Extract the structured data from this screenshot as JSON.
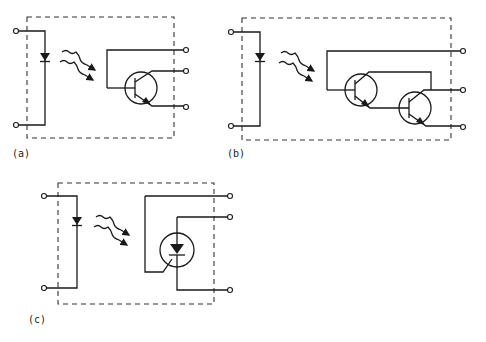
{
  "figure": {
    "panels": [
      {
        "id": "a",
        "label": "(a)",
        "device": "phototransistor optocoupler"
      },
      {
        "id": "b",
        "label": "(b)",
        "device": "photo-Darlington optocoupler"
      },
      {
        "id": "c",
        "label": "(c)",
        "device": "photo-SCR optocoupler"
      }
    ]
  },
  "colors": {
    "ink": "#1a1a1a",
    "background": "#ffffff"
  }
}
